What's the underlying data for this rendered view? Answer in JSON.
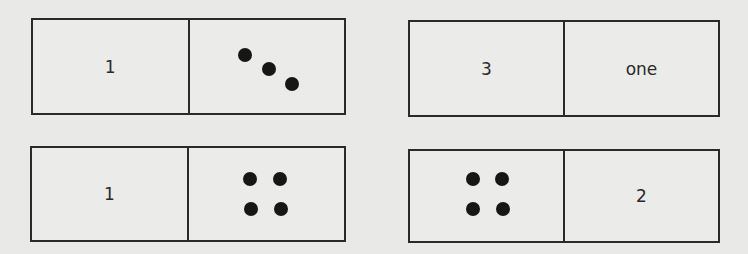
{
  "colors": {
    "background": "#e9e9e7",
    "line": "#2a2a2a",
    "dot": "#161616"
  },
  "dominoes": [
    {
      "id": "top-left",
      "left": {
        "type": "text",
        "text": "1"
      },
      "right": {
        "type": "dots",
        "count": 3,
        "arrangement": "diagonal"
      }
    },
    {
      "id": "top-right",
      "left": {
        "type": "text",
        "text": "3"
      },
      "right": {
        "type": "text",
        "text": "one"
      }
    },
    {
      "id": "bottom-left",
      "left": {
        "type": "text",
        "text": "1"
      },
      "right": {
        "type": "dots",
        "count": 4,
        "arrangement": "square"
      }
    },
    {
      "id": "bottom-right",
      "left": {
        "type": "dots",
        "count": 4,
        "arrangement": "square"
      },
      "right": {
        "type": "text",
        "text": "2"
      }
    }
  ]
}
